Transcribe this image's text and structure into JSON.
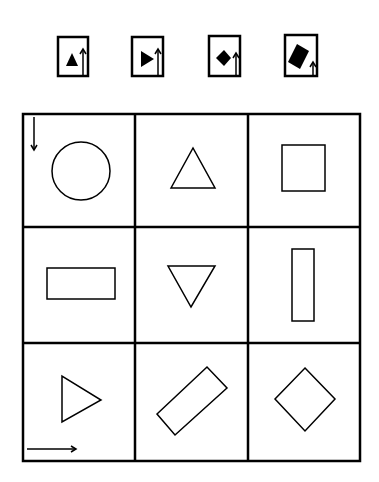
{
  "puzzle": {
    "stroke_color": "#000000",
    "background": "#ffffff",
    "options": [
      {
        "id": "option-1",
        "shape": "filled-triangle-up",
        "arrow": "up-tall"
      },
      {
        "id": "option-2",
        "shape": "filled-triangle-right",
        "arrow": "up-tall"
      },
      {
        "id": "option-3",
        "shape": "filled-diamond",
        "arrow": "up-medium"
      },
      {
        "id": "option-4",
        "shape": "filled-rotated-rectangle",
        "arrow": "up-short"
      }
    ],
    "grid": {
      "rows": 3,
      "cols": 3,
      "axis_arrows": [
        {
          "position": "top-left",
          "direction": "down"
        },
        {
          "position": "bottom-left",
          "direction": "right"
        }
      ],
      "cells": [
        {
          "row": 1,
          "col": 1,
          "shape": "circle"
        },
        {
          "row": 1,
          "col": 2,
          "shape": "triangle-up"
        },
        {
          "row": 1,
          "col": 3,
          "shape": "square"
        },
        {
          "row": 2,
          "col": 1,
          "shape": "horizontal-rectangle"
        },
        {
          "row": 2,
          "col": 2,
          "shape": "triangle-down"
        },
        {
          "row": 2,
          "col": 3,
          "shape": "vertical-rectangle"
        },
        {
          "row": 3,
          "col": 1,
          "shape": "triangle-right"
        },
        {
          "row": 3,
          "col": 2,
          "shape": "rotated-rectangle"
        },
        {
          "row": 3,
          "col": 3,
          "shape": "diamond"
        }
      ]
    }
  }
}
